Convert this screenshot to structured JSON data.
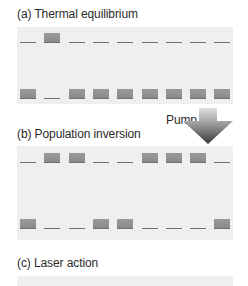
{
  "panels": [
    {
      "id": "a",
      "title": "(a) Thermal equilibrium",
      "upper": [
        0,
        1,
        0,
        0,
        0,
        0,
        0,
        0,
        0
      ],
      "lower": [
        1,
        0,
        1,
        1,
        1,
        1,
        1,
        1,
        1
      ]
    },
    {
      "id": "b",
      "title": "(b) Population inversion",
      "upper": [
        0,
        1,
        1,
        0,
        0,
        1,
        1,
        1,
        0
      ],
      "lower": [
        1,
        0,
        0,
        1,
        1,
        0,
        0,
        0,
        1
      ]
    },
    {
      "id": "c",
      "title": "(c) Laser action"
    }
  ],
  "pump": {
    "label": "Pump"
  },
  "colors": {
    "panel_bg": "#efefef",
    "atom": "#8f8f8f",
    "line": "#707070",
    "arrow_dark": "#3c3c3c",
    "arrow_light": "#d8d8d8"
  }
}
